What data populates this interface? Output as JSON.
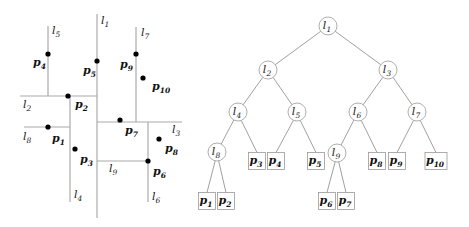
{
  "partition": {
    "lines": [
      {
        "id": "l1",
        "name": "l",
        "sub": "1",
        "x1": 97,
        "y1": 14,
        "x2": 97,
        "y2": 218,
        "lx": 101,
        "ly": 24
      },
      {
        "id": "l2",
        "name": "l",
        "sub": "2",
        "x1": 20,
        "y1": 96,
        "x2": 97,
        "y2": 96,
        "lx": 23,
        "ly": 108
      },
      {
        "id": "l3",
        "name": "l",
        "sub": "3",
        "x1": 97,
        "y1": 122,
        "x2": 182,
        "y2": 122,
        "lx": 172,
        "ly": 133
      },
      {
        "id": "l4",
        "name": "l",
        "sub": "4",
        "x1": 70,
        "y1": 96,
        "x2": 70,
        "y2": 202,
        "lx": 74,
        "ly": 198
      },
      {
        "id": "l5",
        "name": "l",
        "sub": "5",
        "x1": 48,
        "y1": 26,
        "x2": 48,
        "y2": 96,
        "lx": 52,
        "ly": 34
      },
      {
        "id": "l6",
        "name": "l",
        "sub": "6",
        "x1": 148,
        "y1": 122,
        "x2": 148,
        "y2": 202,
        "lx": 152,
        "ly": 200
      },
      {
        "id": "l7",
        "name": "l",
        "sub": "7",
        "x1": 136,
        "y1": 27,
        "x2": 136,
        "y2": 122,
        "lx": 141,
        "ly": 36
      },
      {
        "id": "l8",
        "name": "l",
        "sub": "8",
        "x1": 24,
        "y1": 127,
        "x2": 70,
        "y2": 127,
        "lx": 23,
        "ly": 140
      },
      {
        "id": "l9",
        "name": "l",
        "sub": "9",
        "x1": 97,
        "y1": 161,
        "x2": 148,
        "y2": 161,
        "lx": 109,
        "ly": 172
      }
    ],
    "points": [
      {
        "id": "p1",
        "name": "p",
        "sub": "1",
        "x": 48,
        "y": 127,
        "lx": 52,
        "ly": 142
      },
      {
        "id": "p2",
        "name": "p",
        "sub": "2",
        "x": 68,
        "y": 96,
        "lx": 75,
        "ly": 108
      },
      {
        "id": "p3",
        "name": "p",
        "sub": "3",
        "x": 75,
        "y": 149,
        "lx": 80,
        "ly": 163
      },
      {
        "id": "p4",
        "name": "p",
        "sub": "4",
        "x": 48,
        "y": 54,
        "lx": 33,
        "ly": 66
      },
      {
        "id": "p5",
        "name": "p",
        "sub": "5",
        "x": 97,
        "y": 61,
        "lx": 83,
        "ly": 74
      },
      {
        "id": "p6",
        "name": "p",
        "sub": "6",
        "x": 148,
        "y": 161,
        "lx": 153,
        "ly": 175
      },
      {
        "id": "p7",
        "name": "p",
        "sub": "7",
        "x": 120,
        "y": 120,
        "lx": 125,
        "ly": 134
      },
      {
        "id": "p8",
        "name": "p",
        "sub": "8",
        "x": 159,
        "y": 139,
        "lx": 165,
        "ly": 152
      },
      {
        "id": "p9",
        "name": "p",
        "sub": "9",
        "x": 136,
        "y": 54,
        "lx": 120,
        "ly": 68
      },
      {
        "id": "p10",
        "name": "p",
        "sub": "10",
        "x": 143,
        "y": 78,
        "lx": 152,
        "ly": 90
      }
    ]
  },
  "tree": {
    "internal_nodes": [
      {
        "id": "l1",
        "name": "l",
        "sub": "1",
        "x": 328,
        "y": 26
      },
      {
        "id": "l2",
        "name": "l",
        "sub": "2",
        "x": 268,
        "y": 70
      },
      {
        "id": "l3",
        "name": "l",
        "sub": "3",
        "x": 388,
        "y": 70
      },
      {
        "id": "l4",
        "name": "l",
        "sub": "4",
        "x": 238,
        "y": 112
      },
      {
        "id": "l5",
        "name": "l",
        "sub": "5",
        "x": 297,
        "y": 112
      },
      {
        "id": "l6",
        "name": "l",
        "sub": "6",
        "x": 358,
        "y": 112
      },
      {
        "id": "l7",
        "name": "l",
        "sub": "7",
        "x": 417,
        "y": 112
      },
      {
        "id": "l8",
        "name": "l",
        "sub": "8",
        "x": 217,
        "y": 152
      },
      {
        "id": "l9",
        "name": "l",
        "sub": "9",
        "x": 337,
        "y": 153
      }
    ],
    "leaves": [
      {
        "id": "p1",
        "name": "p",
        "sub": "1",
        "x": 207,
        "y": 201
      },
      {
        "id": "p2",
        "name": "p",
        "sub": "2",
        "x": 226,
        "y": 201
      },
      {
        "id": "p3",
        "name": "p",
        "sub": "3",
        "x": 257,
        "y": 161
      },
      {
        "id": "p4",
        "name": "p",
        "sub": "4",
        "x": 276,
        "y": 161
      },
      {
        "id": "p5",
        "name": "p",
        "sub": "5",
        "x": 316,
        "y": 161
      },
      {
        "id": "p6",
        "name": "p",
        "sub": "6",
        "x": 327,
        "y": 201
      },
      {
        "id": "p7",
        "name": "p",
        "sub": "7",
        "x": 346,
        "y": 201
      },
      {
        "id": "p8",
        "name": "p",
        "sub": "8",
        "x": 377,
        "y": 161
      },
      {
        "id": "p9",
        "name": "p",
        "sub": "9",
        "x": 397,
        "y": 161
      },
      {
        "id": "p10",
        "name": "p",
        "sub": "10",
        "x": 436,
        "y": 161
      }
    ],
    "edges": [
      [
        "l1",
        "l2"
      ],
      [
        "l1",
        "l3"
      ],
      [
        "l2",
        "l4"
      ],
      [
        "l2",
        "l5"
      ],
      [
        "l3",
        "l6"
      ],
      [
        "l3",
        "l7"
      ],
      [
        "l4",
        "l8"
      ],
      [
        "l4",
        "p3"
      ],
      [
        "l5",
        "p4"
      ],
      [
        "l5",
        "p5"
      ],
      [
        "l6",
        "l9"
      ],
      [
        "l6",
        "p8"
      ],
      [
        "l7",
        "p9"
      ],
      [
        "l7",
        "p10"
      ],
      [
        "l8",
        "p1"
      ],
      [
        "l8",
        "p2"
      ],
      [
        "l9",
        "p6"
      ],
      [
        "l9",
        "p7"
      ]
    ]
  },
  "colors": {
    "line": "#aaaaaa",
    "point": "#000000",
    "edge": "#888888",
    "node_stroke": "#999999"
  }
}
